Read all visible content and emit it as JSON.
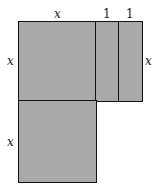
{
  "diagram": {
    "fill_color": "#a9a9a9",
    "stroke_color": "#111111",
    "top_labels": [
      "x",
      "1",
      "1"
    ],
    "left_labels": [
      "x",
      "x"
    ],
    "right_label": "x",
    "tiles": [
      {
        "name": "x-squared-top",
        "width": "x",
        "height": "x"
      },
      {
        "name": "unit-strip-1",
        "width": "1",
        "height": "x"
      },
      {
        "name": "unit-strip-2",
        "width": "1",
        "height": "x"
      },
      {
        "name": "x-squared-bottom",
        "width": "x",
        "height": "x"
      }
    ]
  }
}
